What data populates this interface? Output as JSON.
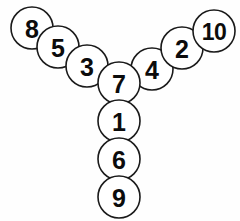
{
  "diagram": {
    "background_color": "#fefefe",
    "circle_fill": "#ffffff",
    "circle_stroke": "#1a1a1a",
    "label_color": "#0c0c0c",
    "radius": 21,
    "nodes": [
      {
        "label": "8",
        "cx": 32,
        "cy": 28,
        "r": 21,
        "branch": "left",
        "z": 1
      },
      {
        "label": "5",
        "cx": 58,
        "cy": 47,
        "r": 21,
        "branch": "left",
        "z": 2
      },
      {
        "label": "3",
        "cx": 87,
        "cy": 66,
        "r": 21,
        "branch": "left",
        "z": 3
      },
      {
        "label": "10",
        "cx": 214,
        "cy": 31,
        "r": 21,
        "branch": "right",
        "z": 4
      },
      {
        "label": "2",
        "cx": 182,
        "cy": 48,
        "r": 21,
        "branch": "right",
        "z": 3
      },
      {
        "label": "4",
        "cx": 152,
        "cy": 69,
        "r": 21,
        "branch": "right",
        "z": 2
      },
      {
        "label": "7",
        "cx": 119,
        "cy": 83,
        "r": 21,
        "branch": "center",
        "z": 5
      },
      {
        "label": "1",
        "cx": 119,
        "cy": 121,
        "r": 21,
        "branch": "center",
        "z": 5
      },
      {
        "label": "6",
        "cx": 119,
        "cy": 159,
        "r": 21,
        "branch": "center",
        "z": 5
      },
      {
        "label": "9",
        "cx": 119,
        "cy": 197,
        "r": 21,
        "branch": "center",
        "z": 5
      }
    ]
  }
}
